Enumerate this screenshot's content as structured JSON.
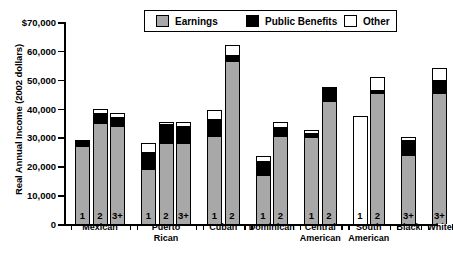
{
  "chart_data": {
    "type": "bar",
    "subtype": "stacked",
    "title": "",
    "xlabel": "",
    "ylabel": "Real Annual Income (2002 dollars)",
    "ylim": [
      0,
      70000
    ],
    "yticks": [
      0,
      10000,
      20000,
      30000,
      40000,
      50000,
      60000,
      70000
    ],
    "ytick_labels": [
      "0",
      "10,000",
      "20,000",
      "30,000",
      "40,000",
      "50,000",
      "60,000",
      "$70,000"
    ],
    "grid": false,
    "legend_position": "top-center",
    "series": [
      {
        "name": "Earnings",
        "color": "#a8a8a8",
        "values": [
          27000,
          35000,
          34000,
          19000,
          28000,
          28000,
          30500,
          56500,
          17000,
          30500,
          30000,
          42500,
          0,
          45500,
          24000,
          45500
        ]
      },
      {
        "name": "Public Benefits",
        "color": "#000000",
        "values": [
          2000,
          3500,
          3000,
          6000,
          6500,
          6000,
          6000,
          2000,
          5000,
          3000,
          1500,
          4500,
          0,
          1000,
          5000,
          4500
        ]
      },
      {
        "name": "Other",
        "color": "#ffffff",
        "values": [
          0,
          1500,
          1500,
          3000,
          1000,
          1500,
          3000,
          3500,
          1500,
          2000,
          1000,
          500,
          37500,
          4500,
          1000,
          4000
        ]
      }
    ],
    "groups": [
      {
        "label": "Mexican",
        "bars": [
          "1",
          "2",
          "3+"
        ]
      },
      {
        "label": "Puerto\nRican",
        "bars": [
          "1",
          "2",
          "3+"
        ]
      },
      {
        "label": "Cuban",
        "bars": [
          "1",
          "2"
        ]
      },
      {
        "label": "Dominican",
        "bars": [
          "1",
          "2"
        ]
      },
      {
        "label": "Central\nAmerican",
        "bars": [
          "1",
          "2"
        ]
      },
      {
        "label": "South\nAmerican",
        "bars": [
          "1",
          "2"
        ]
      },
      {
        "label": "Black",
        "bars": [
          "3+"
        ]
      },
      {
        "label": "White",
        "bars": [
          "3+"
        ]
      }
    ],
    "bar_labels": [
      "1",
      "2",
      "3+",
      "1",
      "2",
      "3+",
      "1",
      "2",
      "1",
      "2",
      "1",
      "2",
      "1",
      "2",
      "3+",
      "3+"
    ],
    "totals": [
      29000,
      40000,
      38500,
      28000,
      35500,
      35500,
      39500,
      62000,
      23500,
      35500,
      32500,
      47500,
      37500,
      51000,
      30000,
      54000
    ]
  },
  "legend": {
    "items": [
      {
        "label": "Earnings",
        "swatch": "earnings-swatch"
      },
      {
        "label": "Public Benefits",
        "swatch": "public-benefits-swatch"
      },
      {
        "label": "Other",
        "swatch": "other-swatch"
      }
    ]
  },
  "group_labels": {
    "mexican": "Mexican",
    "puerto_rican_line1": "Puerto",
    "puerto_rican_line2": "Rican",
    "cuban": "Cuban",
    "dominican": "Dominican",
    "central_line1": "Central",
    "central_line2": "American",
    "south_line1": "South",
    "south_line2": "American",
    "black": "Black",
    "white": "White"
  }
}
